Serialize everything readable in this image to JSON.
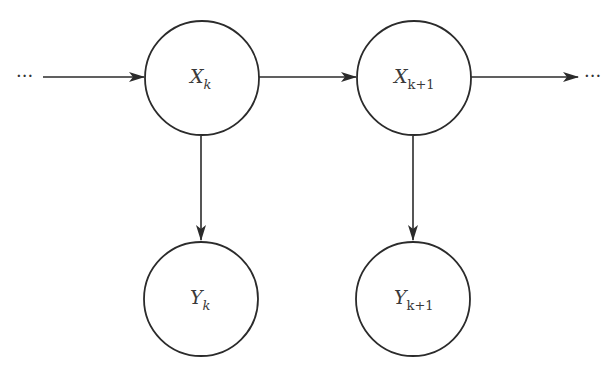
{
  "diagram": {
    "type": "hidden-markov-model",
    "colors": {
      "stroke": "#2b2b2b",
      "text": "#3a3a3a",
      "background": "#ffffff"
    },
    "nodes": [
      {
        "id": "x_k",
        "base": "X",
        "sub": "k",
        "role": "hidden-state",
        "cx": 202,
        "cy": 78,
        "r": 57
      },
      {
        "id": "x_k1",
        "base": "X",
        "sub": "k+1",
        "role": "hidden-state",
        "cx": 414,
        "cy": 78,
        "r": 57
      },
      {
        "id": "y_k",
        "base": "Y",
        "sub": "k",
        "role": "observation",
        "cx": 201,
        "cy": 299,
        "r": 57
      },
      {
        "id": "y_k1",
        "base": "Y",
        "sub": "k+1",
        "role": "observation",
        "cx": 413,
        "cy": 299,
        "r": 57
      }
    ],
    "edges": [
      {
        "from": "prev",
        "to": "x_k"
      },
      {
        "from": "x_k",
        "to": "x_k1"
      },
      {
        "from": "x_k1",
        "to": "next"
      },
      {
        "from": "x_k",
        "to": "y_k"
      },
      {
        "from": "x_k1",
        "to": "y_k1"
      }
    ],
    "ellipsis_left": "···",
    "ellipsis_right": "···"
  }
}
